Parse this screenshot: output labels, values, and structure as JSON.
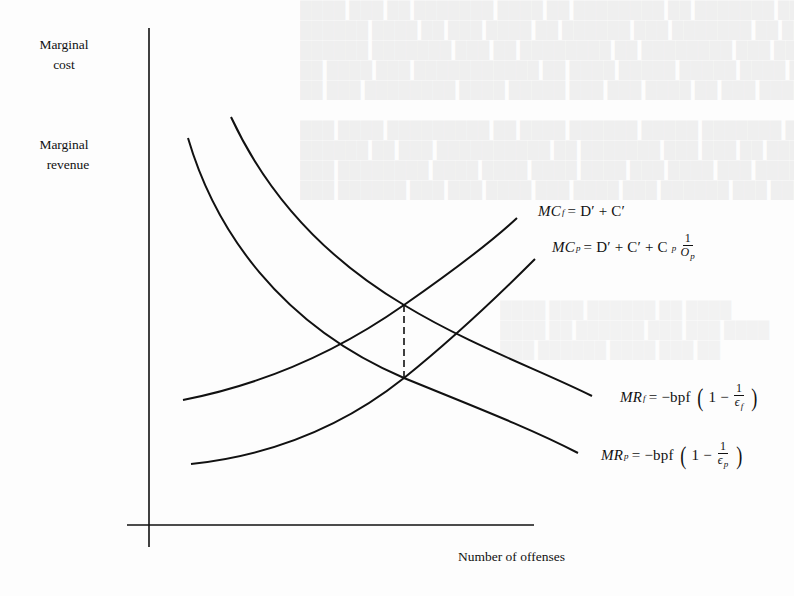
{
  "figure": {
    "y_axis_labels": [
      "Marginal cost",
      "Marginal revenue"
    ],
    "y_axis_label_lines": {
      "cost_line1": "Marginal",
      "cost_line2": "cost",
      "revenue_line1": "Marginal",
      "revenue_line2": "revenue"
    },
    "x_axis_label": "Number of offenses",
    "curves": [
      {
        "name": "MC_f",
        "label": "MCf = D' + C'",
        "shape": "increasing convex",
        "path": [
          [
            183,
            400
          ],
          [
            290,
            362
          ],
          [
            404,
            305
          ],
          [
            517,
            218
          ]
        ]
      },
      {
        "name": "MC_p",
        "label": "MCp = D' + C' + Cp (1/Op)",
        "shape": "increasing convex, above MC_f shift",
        "path": [
          [
            191,
            464
          ],
          [
            300,
            440
          ],
          [
            404,
            378
          ],
          [
            535,
            259
          ]
        ]
      },
      {
        "name": "MR_f",
        "label": "MRf = -bpf (1 - 1/εf)",
        "shape": "decreasing convex",
        "path": [
          [
            231,
            117
          ],
          [
            300,
            225
          ],
          [
            404,
            305
          ],
          [
            592,
            396
          ]
        ]
      },
      {
        "name": "MR_p",
        "label": "MRp = -bpf (1 - 1/εp)",
        "shape": "decreasing convex",
        "path": [
          [
            188,
            138
          ],
          [
            260,
            275
          ],
          [
            404,
            378
          ],
          [
            578,
            453
          ]
        ]
      }
    ],
    "dashed_line": {
      "x": 404,
      "y_top": 305,
      "y_bottom": 378
    },
    "equations": {
      "mcf": {
        "lhs": "MC",
        "sub": "f",
        "rhs": "= D′ + C′"
      },
      "mcp": {
        "lhs": "MC",
        "sub": "p",
        "rhs": "= D′ + C′ + C",
        "rhs_sub": "p",
        "frac_num": "1",
        "frac_den": "O",
        "frac_den_sub": "p"
      },
      "mrf": {
        "lhs": "MR",
        "sub": "f",
        "rhs": "= −bpf",
        "one_minus": "1 −",
        "frac_num": "1",
        "frac_den": "ϵ",
        "frac_den_sub": "f"
      },
      "mrp": {
        "lhs": "MR",
        "sub": "p",
        "rhs": "= −bpf",
        "one_minus": "1 −",
        "frac_num": "1",
        "frac_den": "ϵ",
        "frac_den_sub": "p"
      }
    },
    "paren_open": "(",
    "paren_close": ")"
  }
}
